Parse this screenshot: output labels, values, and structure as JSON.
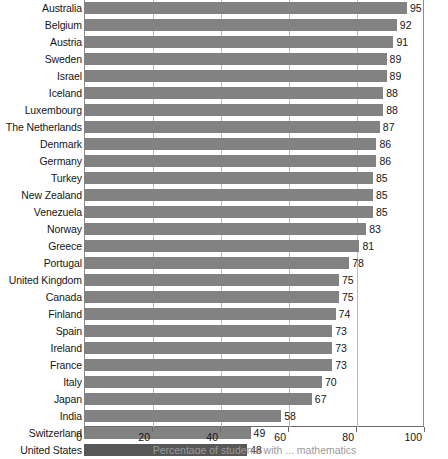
{
  "chart_data": {
    "type": "bar",
    "orientation": "horizontal",
    "title": "",
    "xlabel": "Percentage of students with ... mathematics",
    "ylabel": "",
    "xlim": [
      0,
      100
    ],
    "xticks": [
      0,
      20,
      40,
      60,
      80,
      100
    ],
    "grid": true,
    "legend": null,
    "bar_color": "#828282",
    "highlight_color": "#575757",
    "highlight_category": "United States",
    "categories": [
      "Australia",
      "Belgium",
      "Austria",
      "Sweden",
      "Israel",
      "Iceland",
      "Luxembourg",
      "The Netherlands",
      "Denmark",
      "Germany",
      "Turkey",
      "New Zealand",
      "Venezuela",
      "Norway",
      "Greece",
      "Portugal",
      "United Kingdom",
      "Canada",
      "Finland",
      "Spain",
      "Ireland",
      "France",
      "Italy",
      "Japan",
      "India",
      "Switzerland",
      "United States"
    ],
    "values": [
      95,
      92,
      91,
      89,
      89,
      88,
      88,
      87,
      86,
      86,
      85,
      85,
      85,
      83,
      81,
      78,
      75,
      75,
      74,
      73,
      73,
      73,
      70,
      67,
      58,
      49,
      48
    ],
    "value_labels": [
      "95",
      "92",
      "91",
      "89",
      "89",
      "88",
      "88",
      "87",
      "86",
      "86",
      "85",
      "85",
      "85",
      "83",
      "81",
      "78",
      "75",
      "75",
      "74",
      "73",
      "73",
      "73",
      "70",
      "67",
      "58",
      "49",
      "48"
    ],
    "xtick_labels": [
      "0",
      "20",
      "40",
      "60",
      "80",
      "100"
    ]
  }
}
